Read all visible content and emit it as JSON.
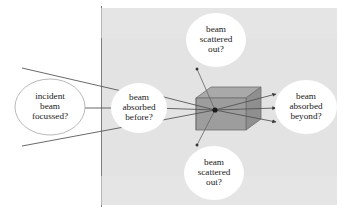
{
  "figure": {
    "type": "diagram",
    "background_color": "#ffffff",
    "panel_color": "#e3e3e3",
    "panel_border_color": "#8c8c8c",
    "slab_top_color": "#a3a3a3",
    "slab_front_color": "#9a9a9a",
    "slab_edge_color": "#6e6e6e",
    "line_color": "#555555",
    "marker_color": "#333333",
    "node_fill": "#ffffff",
    "node_outline": "#b5b5b5",
    "text_color": "#1a1a1a"
  },
  "nodes": [
    {
      "id": "incident-beam-focussed",
      "lines": [
        "incident",
        "beam",
        "focussed?"
      ],
      "shape": "ellipse",
      "cx": 50,
      "cy": 107,
      "rx": 35,
      "ry": 28,
      "outlined": true
    },
    {
      "id": "beam-absorbed-before",
      "lines": [
        "beam",
        "absorbed",
        "before?"
      ],
      "shape": "ellipse",
      "cx": 139,
      "cy": 108,
      "rx": 28,
      "ry": 25,
      "outlined": false
    },
    {
      "id": "beam-scattered-out-top",
      "lines": [
        "beam",
        "scattered",
        "out?"
      ],
      "shape": "ellipse",
      "cx": 216,
      "cy": 40,
      "rx": 30,
      "ry": 27,
      "outlined": false
    },
    {
      "id": "beam-scattered-out-bottom",
      "lines": [
        "beam",
        "scattered",
        "out?"
      ],
      "shape": "ellipse",
      "cx": 214,
      "cy": 173,
      "rx": 30,
      "ry": 27,
      "outlined": false
    },
    {
      "id": "beam-absorbed-beyond",
      "lines": [
        "beam",
        "absorbed",
        "beyond?"
      ],
      "shape": "ellipse",
      "cx": 306,
      "cy": 107,
      "rx": 31,
      "ry": 27,
      "outlined": false
    }
  ],
  "panel": {
    "x": 101,
    "y": 8,
    "width": 236,
    "height": 197
  },
  "slab": {
    "front": {
      "x": 196,
      "y": 98,
      "width": 50,
      "height": 32
    },
    "top_face": [
      [
        196,
        98
      ],
      [
        211,
        87
      ],
      [
        261,
        87
      ],
      [
        246,
        98
      ]
    ],
    "right_face": [
      [
        246,
        98
      ],
      [
        261,
        87
      ],
      [
        261,
        119
      ],
      [
        246,
        130
      ]
    ]
  },
  "scatter_point": {
    "x": 215,
    "y": 110,
    "radius": 2.6
  },
  "rays": {
    "incident_outer_top": {
      "from": [
        22,
        68
      ],
      "to": [
        127,
        92
      ]
    },
    "incident_center": {
      "from": [
        85,
        108
      ],
      "to": [
        118,
        108
      ]
    },
    "incident_outer_bottom": {
      "from": [
        22,
        146
      ],
      "to": [
        125,
        127
      ]
    },
    "through_top": {
      "from": [
        150,
        96
      ],
      "to": [
        215,
        110
      ]
    },
    "through_center": {
      "from": [
        153,
        108
      ],
      "to": [
        215,
        110
      ]
    },
    "through_bottom": {
      "from": [
        150,
        121
      ],
      "to": [
        215,
        110
      ]
    },
    "out_top": {
      "from": [
        215,
        110
      ],
      "to": [
        277,
        94
      ]
    },
    "out_center": {
      "from": [
        215,
        110
      ],
      "to": [
        277,
        108
      ]
    },
    "out_bottom": {
      "from": [
        215,
        110
      ],
      "to": [
        277,
        122
      ]
    },
    "scattered_up": {
      "from": [
        215,
        110
      ],
      "to": [
        196,
        67
      ]
    },
    "scattered_down": {
      "from": [
        215,
        110
      ],
      "to": [
        196,
        147
      ]
    }
  }
}
